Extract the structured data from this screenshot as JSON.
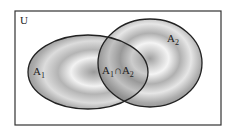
{
  "diagram": {
    "type": "venn",
    "universe_label": "U",
    "sets": [
      {
        "label": "A",
        "subscript": "1"
      },
      {
        "label": "A",
        "subscript": "2"
      }
    ],
    "intersection": {
      "a": "A",
      "a_sub": "1",
      "op": "∩",
      "b": "A",
      "b_sub": "2"
    }
  }
}
